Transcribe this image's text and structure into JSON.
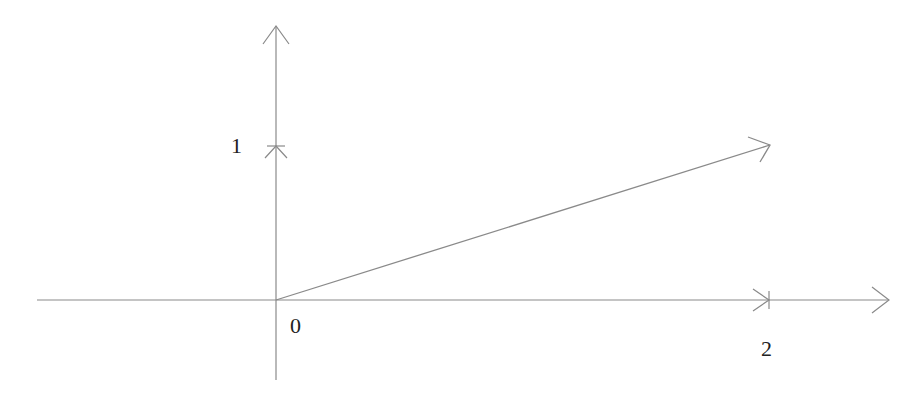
{
  "diagram": {
    "type": "vector-on-axes",
    "colors": {
      "axis": "#8a8a8a",
      "vector": "#8a8a8a",
      "label": "#222222",
      "background": "#ffffff"
    },
    "labels": {
      "origin": "0",
      "y_tick": "1",
      "x_tick": "2"
    },
    "vector": {
      "from": [
        0,
        0
      ],
      "to": [
        2,
        1
      ]
    },
    "ticks": {
      "x": [
        2
      ],
      "y": [
        1
      ]
    }
  }
}
